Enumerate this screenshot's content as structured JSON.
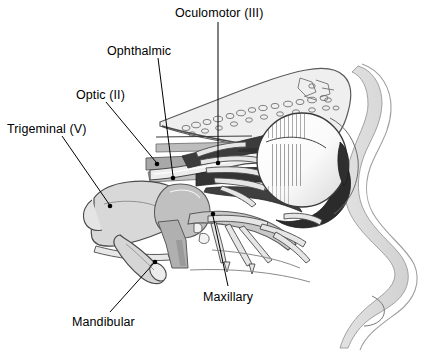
{
  "figure": {
    "background_color": "#ffffff",
    "text_color": "#000000",
    "width": 429,
    "height": 353
  },
  "labels": {
    "oculomotor": "Oculomotor (III)",
    "ophthalmic": "Ophthalmic",
    "optic": "Optic (II)",
    "trigeminal": "Trigeminal (V)",
    "maxillary": "Maxillary",
    "mandibular": "Mandibular"
  },
  "leaders": [
    {
      "name": "oculomotor",
      "from": [
        218,
        22
      ],
      "to": [
        218,
        163
      ],
      "dot": [
        218,
        163
      ]
    },
    {
      "name": "ophthalmic",
      "from": [
        158,
        58
      ],
      "to": [
        173,
        178
      ],
      "dot": [
        173,
        178
      ]
    },
    {
      "name": "optic",
      "from": [
        106,
        102
      ],
      "to": [
        157,
        164
      ],
      "dot": [
        157,
        164
      ]
    },
    {
      "name": "trigeminal",
      "from": [
        62,
        136
      ],
      "to": [
        110,
        206
      ],
      "dot": [
        110,
        206
      ]
    },
    {
      "name": "maxillary",
      "from": [
        228,
        286
      ],
      "to": [
        213,
        214
      ],
      "dot": [
        213,
        214
      ]
    },
    {
      "name": "mandibular",
      "from": [
        110,
        312
      ],
      "to": [
        155,
        262
      ],
      "dot": [
        155,
        262
      ]
    }
  ],
  "structures": [
    {
      "name": "facial-profile-soft-tissue",
      "tone": "#dcdcdc"
    },
    {
      "name": "frontal-bone-trabeculae",
      "tone": "#e8e8e8"
    },
    {
      "name": "eyeball-sclera",
      "tone": "#fbfbfb"
    },
    {
      "name": "eyeball-posterior-chamber",
      "tone": "#2a2a2a"
    },
    {
      "name": "extraocular-muscles",
      "tone": "#3a3a3a"
    },
    {
      "name": "trigeminal-ganglion",
      "tone": "#d2d2d2"
    },
    {
      "name": "sphenoid-bone",
      "tone": "#b5b5b5"
    },
    {
      "name": "nerve-branches",
      "tone": "#e2e2e2"
    },
    {
      "name": "dura-cut-bands",
      "tone": "#9a9a9a"
    }
  ],
  "palette": {
    "outline": "#4a4a4a",
    "dark_fill": "#333333",
    "mid_gray": "#b5b5b5",
    "light_gray": "#dcdcdc",
    "pale_gray": "#efefef",
    "white": "#ffffff"
  }
}
